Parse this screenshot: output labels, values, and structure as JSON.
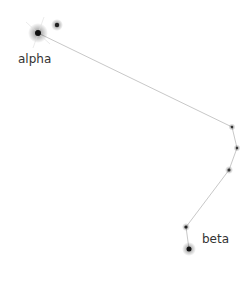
{
  "diagram": {
    "type": "constellation",
    "stars": [
      {
        "id": "alpha",
        "label": "alpha",
        "x": 38,
        "y": 33,
        "size": "bright"
      },
      {
        "id": "companion",
        "label": "",
        "x": 57,
        "y": 25,
        "size": "medium"
      },
      {
        "id": "s3",
        "label": "",
        "x": 232,
        "y": 127,
        "size": "faint"
      },
      {
        "id": "s4",
        "label": "",
        "x": 237,
        "y": 148,
        "size": "faint"
      },
      {
        "id": "s5",
        "label": "",
        "x": 229,
        "y": 170,
        "size": "faint"
      },
      {
        "id": "s6",
        "label": "",
        "x": 186,
        "y": 227,
        "size": "faint"
      },
      {
        "id": "beta",
        "label": "beta",
        "x": 189,
        "y": 249,
        "size": "medium"
      }
    ],
    "lines": [
      [
        "alpha",
        "s3"
      ],
      [
        "s3",
        "s4"
      ],
      [
        "s4",
        "s5"
      ],
      [
        "s5",
        "s6"
      ],
      [
        "s6",
        "beta"
      ]
    ],
    "labels": {
      "alpha": "alpha",
      "beta": "beta"
    },
    "colors": {
      "line": "#c8c8c8",
      "star": "#222222",
      "label": "#333333"
    }
  }
}
